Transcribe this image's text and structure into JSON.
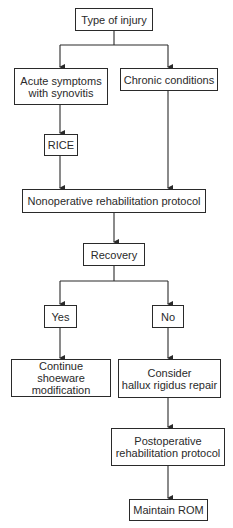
{
  "diagram": {
    "type": "flowchart",
    "nodes": [
      {
        "id": "type_of_injury",
        "label": "Type of injury"
      },
      {
        "id": "acute",
        "label_line1": "Acute symptoms",
        "label_line2": "with synovitis"
      },
      {
        "id": "chronic",
        "label": "Chronic conditions"
      },
      {
        "id": "rice",
        "label": "RICE"
      },
      {
        "id": "nonoperative",
        "label": "Nonoperative rehabilitation protocol"
      },
      {
        "id": "recovery",
        "label": "Recovery"
      },
      {
        "id": "yes",
        "label": "Yes"
      },
      {
        "id": "no",
        "label": "No"
      },
      {
        "id": "continue_shoeware",
        "label_line1": "Continue shoeware",
        "label_line2": "modification"
      },
      {
        "id": "consider_repair",
        "label_line1": "Consider",
        "label_line2": "hallux rigidus repair"
      },
      {
        "id": "postoperative",
        "label_line1": "Postoperative",
        "label_line2": "rehabilitation protocol"
      },
      {
        "id": "maintain_rom",
        "label": "Maintain ROM"
      }
    ],
    "edges": [
      [
        "type_of_injury",
        "acute"
      ],
      [
        "type_of_injury",
        "chronic"
      ],
      [
        "acute",
        "rice"
      ],
      [
        "rice",
        "nonoperative"
      ],
      [
        "chronic",
        "nonoperative"
      ],
      [
        "nonoperative",
        "recovery"
      ],
      [
        "recovery",
        "yes"
      ],
      [
        "recovery",
        "no"
      ],
      [
        "yes",
        "continue_shoeware"
      ],
      [
        "no",
        "consider_repair"
      ],
      [
        "consider_repair",
        "postoperative"
      ],
      [
        "postoperative",
        "maintain_rom"
      ]
    ],
    "colors": {
      "stroke": "#2a2a2a",
      "background": "#ffffff"
    }
  }
}
